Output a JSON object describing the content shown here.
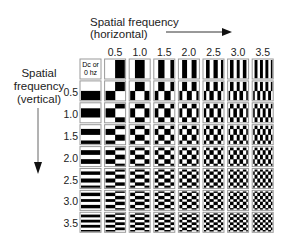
{
  "horizontal_axis": {
    "title": "Spatial frequency",
    "subtitle": "(horizontal)",
    "direction": "right"
  },
  "vertical_axis": {
    "title_line1": "Spatial",
    "title_line2": "frequency",
    "title_line3": "(vertical)",
    "direction": "down"
  },
  "dc_cell": {
    "line1": "Dc or",
    "line2": "0 hz"
  },
  "column_frequencies": [
    "0.5",
    "1.0",
    "1.5",
    "2.0",
    "2.5",
    "3.0",
    "3.5"
  ],
  "row_frequencies": [
    "0.5",
    "1.0",
    "1.5",
    "2.0",
    "2.5",
    "3.0",
    "3.5"
  ],
  "frequency_values": [
    0,
    0.5,
    1.0,
    1.5,
    2.0,
    2.5,
    3.0,
    3.5
  ],
  "colors": {
    "positive": "#ffffff",
    "negative": "#000000",
    "cell_border": "#9a9a9a",
    "text": "#222222",
    "arrow": "#444444"
  }
}
